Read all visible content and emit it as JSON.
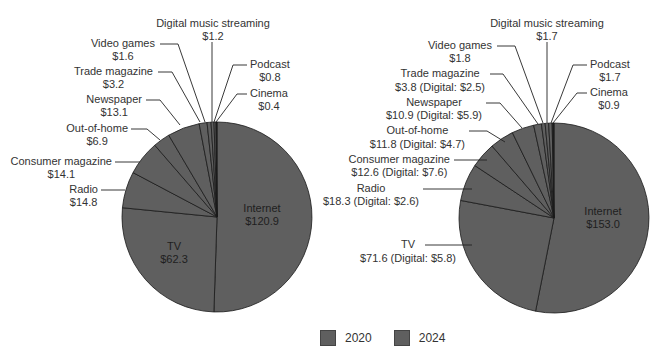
{
  "colors": {
    "fill": "#5f5f5f",
    "stroke": "#1a1a1a",
    "dark_slice": "#1f1f1f",
    "text": "#333333"
  },
  "legend": {
    "items": [
      {
        "label": "2020"
      },
      {
        "label": "2024"
      }
    ]
  },
  "chart_data": [
    {
      "type": "pie",
      "title": "2020",
      "center": [
        217,
        217
      ],
      "radius": 95,
      "slices": [
        {
          "name": "Internet",
          "value": 120.9,
          "text": "$120.9",
          "inside": true,
          "lx": 262,
          "ly": 212
        },
        {
          "name": "TV",
          "value": 62.3,
          "text": "$62.3",
          "inside": true,
          "lx": 174,
          "ly": 250
        },
        {
          "name": "Radio",
          "value": 14.8,
          "text": "$14.8",
          "anchor": "end",
          "lx": 98,
          "ly": 193,
          "line": [
            [
              101,
              190
            ],
            [
              125,
              190
            ]
          ]
        },
        {
          "name": "Consumer magazine",
          "value": 14.1,
          "text": "$14.1",
          "anchor": "end",
          "lx": 112,
          "ly": 165,
          "line": [
            [
              115,
              162
            ],
            [
              140,
              162
            ]
          ]
        },
        {
          "name": "Out-of-home",
          "value": 6.9,
          "text": "$6.9",
          "anchor": "end",
          "lx": 128,
          "ly": 132,
          "line": [
            [
              131,
              129
            ],
            [
              147,
              129
            ],
            [
              160,
              140
            ]
          ]
        },
        {
          "name": "Newspaper",
          "value": 13.1,
          "text": "$13.1",
          "anchor": "end",
          "lx": 142,
          "ly": 103,
          "line": [
            [
              146,
              100
            ],
            [
              160,
              100
            ],
            [
              180,
              125
            ]
          ]
        },
        {
          "name": "Trade magazine",
          "value": 3.2,
          "text": "$3.2",
          "anchor": "end",
          "lx": 153,
          "ly": 75,
          "line": [
            [
              158,
              72
            ],
            [
              172,
              72
            ],
            [
              200,
              122
            ]
          ]
        },
        {
          "name": "Video games",
          "value": 1.6,
          "text": "$1.6",
          "anchor": "end",
          "lx": 155,
          "ly": 47,
          "line": [
            [
              160,
              44
            ],
            [
              178,
              44
            ],
            [
              205,
              122
            ]
          ]
        },
        {
          "name": "Digital music streaming",
          "value": 1.2,
          "text": "$1.2",
          "anchor": "middle",
          "lx": 213,
          "ly": 27,
          "line": [
            [
              212,
              42
            ],
            [
              212,
              122
            ]
          ]
        },
        {
          "name": "Podcast",
          "value": 0.8,
          "text": "$0.8",
          "anchor": "start",
          "lx": 250,
          "ly": 68,
          "line": [
            [
              247,
              65
            ],
            [
              233,
              65
            ],
            [
              214,
              122
            ]
          ]
        },
        {
          "name": "Cinema",
          "value": 0.4,
          "text": "$0.4",
          "anchor": "start",
          "lx": 250,
          "ly": 97,
          "line": [
            [
              247,
              94
            ],
            [
              237,
              94
            ],
            [
              216,
              122
            ]
          ],
          "dark": true
        }
      ]
    },
    {
      "type": "pie",
      "title": "2024",
      "center": [
        554,
        218
      ],
      "radius": 95,
      "slices": [
        {
          "name": "Internet",
          "value": 153.0,
          "text": "$153.0",
          "inside": true,
          "lx": 603,
          "ly": 215
        },
        {
          "name": "TV",
          "value": 71.6,
          "text": "$71.6 (Digital: $5.8)",
          "anchor": "end",
          "lx": 456,
          "ly": 248,
          "sub_dy": 14,
          "line": [
            [
              425,
              245
            ],
            [
              472,
              245
            ]
          ]
        },
        {
          "name": "Radio",
          "value": 18.3,
          "text": "$18.3 (Digital: $2.6)",
          "anchor": "end",
          "lx": 419,
          "ly": 192,
          "sub_dy": 13,
          "line": [
            [
              423,
              189
            ],
            [
              472,
              189
            ]
          ]
        },
        {
          "name": "Consumer magazine",
          "value": 12.6,
          "text": "$12.6 (Digital: $7.6)",
          "anchor": "end",
          "lx": 450,
          "ly": 163,
          "sub_dy": 13,
          "line": [
            [
              454,
              160
            ],
            [
              487,
              160
            ]
          ]
        },
        {
          "name": "Out-of-home",
          "value": 11.8,
          "text": "$11.8 (Digital: $4.7)",
          "anchor": "end",
          "lx": 465,
          "ly": 134,
          "sub_dy": 14,
          "line": [
            [
              469,
              131
            ],
            [
              487,
              131
            ],
            [
              505,
              142
            ]
          ]
        },
        {
          "name": "Newspaper",
          "value": 10.9,
          "text": "$10.9 (Digital: $5.9)",
          "anchor": "end",
          "lx": 482,
          "ly": 106,
          "sub_dy": 13,
          "line": [
            [
              486,
              103
            ],
            [
              500,
              103
            ],
            [
              522,
              128
            ]
          ]
        },
        {
          "name": "Trade magazine",
          "value": 3.8,
          "text": "$3.8 (Digital: $2.5)",
          "anchor": "end",
          "lx": 485,
          "ly": 77,
          "sub_dy": 14,
          "line": [
            [
              490,
              74
            ],
            [
              503,
              74
            ],
            [
              538,
              124
            ]
          ]
        },
        {
          "name": "Video games",
          "value": 1.8,
          "text": "$1.8",
          "anchor": "end",
          "lx": 492,
          "ly": 49,
          "line": [
            [
              497,
              46
            ],
            [
              515,
              46
            ],
            [
              543,
              123
            ]
          ]
        },
        {
          "name": "Digital music streaming",
          "value": 1.7,
          "text": "$1.7",
          "anchor": "middle",
          "lx": 547,
          "ly": 27,
          "line": [
            [
              547,
              42
            ],
            [
              547,
              123
            ]
          ]
        },
        {
          "name": "Podcast",
          "value": 1.7,
          "text": "$1.7",
          "anchor": "start",
          "lx": 590,
          "ly": 68,
          "line": [
            [
              587,
              65
            ],
            [
              573,
              65
            ],
            [
              551,
              123
            ]
          ]
        },
        {
          "name": "Cinema",
          "value": 0.9,
          "text": "$0.9",
          "anchor": "start",
          "lx": 590,
          "ly": 96,
          "line": [
            [
              587,
              93
            ],
            [
              577,
              93
            ],
            [
              553,
              123
            ]
          ],
          "dark": true
        }
      ]
    }
  ]
}
